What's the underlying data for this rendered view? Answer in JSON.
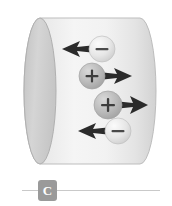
{
  "figure": {
    "background_color": "#ffffff",
    "cylinder": {
      "name": "cylindrical-conductor",
      "body_fill_light": "#f2f2f2",
      "body_fill_mid": "#e2e2e2",
      "body_fill_dark": "#cfcfcf",
      "cap_fill": "#cccccc",
      "outline_color": "#b4b4b4",
      "left_cap_center_x": 40,
      "left_cap_rx": 16,
      "left_cap_ry": 73,
      "right_cap_center_x": 140,
      "top_y": 18,
      "bottom_y": 164
    },
    "particles": [
      {
        "id": "particle-1",
        "charge_label": "−",
        "charge_name": "negative",
        "cx": 102,
        "cy": 49,
        "r": 13,
        "fill": "#dcdcdc",
        "highlight": "#f4f4f4",
        "arrow": {
          "name": "arrow-left",
          "direction": "left",
          "tip_x": 62,
          "tail_x": 96,
          "y": 49,
          "color": "#2b2b2b"
        }
      },
      {
        "id": "particle-2",
        "charge_label": "+",
        "charge_name": "positive",
        "cx": 92,
        "cy": 76,
        "r": 13,
        "fill": "#b6b6b6",
        "highlight": "#d8d8d8",
        "arrow": {
          "name": "arrow-right",
          "direction": "right",
          "tip_x": 132,
          "tail_x": 99,
          "y": 76,
          "color": "#2b2b2b"
        }
      },
      {
        "id": "particle-3",
        "charge_label": "+",
        "charge_name": "positive",
        "cx": 108,
        "cy": 105,
        "r": 14,
        "fill": "#b6b6b6",
        "highlight": "#d8d8d8",
        "arrow": {
          "name": "arrow-right",
          "direction": "right",
          "tip_x": 148,
          "tail_x": 114,
          "y": 105,
          "color": "#2b2b2b"
        }
      },
      {
        "id": "particle-4",
        "charge_label": "−",
        "charge_name": "negative",
        "cx": 118,
        "cy": 131,
        "r": 13,
        "fill": "#dcdcdc",
        "highlight": "#f4f4f4",
        "arrow": {
          "name": "arrow-left",
          "direction": "left",
          "tip_x": 78,
          "tail_x": 112,
          "y": 131,
          "color": "#2b2b2b"
        }
      }
    ]
  },
  "caption": {
    "badge_label": "C",
    "badge_color": "#9a9a9a",
    "badge_text_color": "#ffffff",
    "rule_color": "#c9c9c9"
  }
}
